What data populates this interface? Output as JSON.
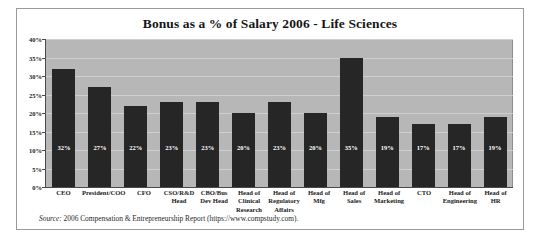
{
  "chart_data": {
    "type": "bar",
    "title": "Bonus as a % of Salary 2006 - Life Sciences",
    "xlabel": "",
    "ylabel": "",
    "ylim": [
      0,
      40
    ],
    "ytick_labels": [
      "0%",
      "5%",
      "10%",
      "15%",
      "20%",
      "25%",
      "30%",
      "35%",
      "40%"
    ],
    "ytick_values": [
      0,
      5,
      10,
      15,
      20,
      25,
      30,
      35,
      40
    ],
    "grid": true,
    "legend": "none",
    "categories": [
      "CEO",
      "President/COO",
      "CFO",
      "CSO/R&D Head",
      "CBO/Bus Dev Head",
      "Head of Clinical Research",
      "Head of Regulatory Affairs",
      "Head of Mfg",
      "Head of Sales",
      "Head of Marketing",
      "CTO",
      "Head of Engineering",
      "Head of HR"
    ],
    "values": [
      32,
      27,
      22,
      23,
      23,
      20,
      23,
      20,
      35,
      19,
      17,
      17,
      19
    ],
    "data_labels": [
      "32%",
      "27%",
      "22%",
      "23%",
      "23%",
      "20%",
      "23%",
      "20%",
      "35%",
      "19%",
      "17%",
      "17%",
      "19%"
    ],
    "bar_color": "#262626",
    "plot_background": "#b7b7b7",
    "gridline_color": "#cfcfcf"
  },
  "source": {
    "label": "Source:",
    "text": " 2006 Compensation & Entrepreneurship Report (https://www.compstudy.com)."
  }
}
